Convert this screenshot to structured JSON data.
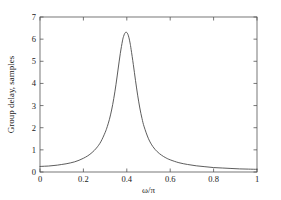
{
  "chart_data": {
    "type": "line",
    "title": "",
    "xlabel": "ω/π",
    "ylabel": "Group delay, samples",
    "xlim": [
      0,
      1
    ],
    "ylim": [
      0,
      7
    ],
    "xticks": [
      0,
      0.2,
      0.4,
      0.6,
      0.8,
      1
    ],
    "xticklabels": [
      "0",
      "0.2",
      "0.4",
      "0.6",
      "0.8",
      "1"
    ],
    "yticks": [
      0,
      1,
      2,
      3,
      4,
      5,
      6,
      7
    ],
    "yticklabels": [
      "0",
      "1",
      "2",
      "3",
      "4",
      "5",
      "6",
      "7"
    ],
    "grid": false,
    "legend": false,
    "line_color": "#4a4a4a",
    "axis_color": "#555555",
    "background_color": "#ffffff",
    "peak": {
      "x": 0.4,
      "y": 6.3
    },
    "series": [
      {
        "name": "Group delay",
        "x": [
          0.0,
          0.02,
          0.04,
          0.06,
          0.08,
          0.1,
          0.12,
          0.14,
          0.16,
          0.18,
          0.2,
          0.22,
          0.24,
          0.26,
          0.28,
          0.3,
          0.31,
          0.32,
          0.33,
          0.34,
          0.35,
          0.36,
          0.37,
          0.38,
          0.385,
          0.39,
          0.395,
          0.4,
          0.405,
          0.41,
          0.415,
          0.42,
          0.43,
          0.44,
          0.45,
          0.46,
          0.47,
          0.48,
          0.5,
          0.52,
          0.54,
          0.56,
          0.58,
          0.6,
          0.64,
          0.68,
          0.72,
          0.76,
          0.8,
          0.84,
          0.88,
          0.92,
          0.96,
          1.0
        ],
        "y": [
          0.25,
          0.26,
          0.27,
          0.29,
          0.31,
          0.34,
          0.37,
          0.41,
          0.46,
          0.53,
          0.62,
          0.73,
          0.88,
          1.08,
          1.36,
          1.78,
          2.05,
          2.38,
          2.8,
          3.32,
          3.94,
          4.65,
          5.35,
          5.92,
          6.12,
          6.25,
          6.31,
          6.3,
          6.22,
          6.06,
          5.83,
          5.53,
          4.86,
          4.14,
          3.47,
          2.89,
          2.42,
          2.04,
          1.5,
          1.15,
          0.92,
          0.76,
          0.64,
          0.55,
          0.42,
          0.34,
          0.28,
          0.24,
          0.2,
          0.18,
          0.16,
          0.14,
          0.13,
          0.12
        ]
      }
    ]
  },
  "axes": {
    "x_label": "ω/π",
    "y_label": "Group delay, samples"
  }
}
